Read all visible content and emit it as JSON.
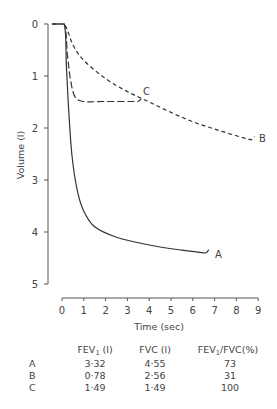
{
  "chart_data": {
    "type": "line",
    "title": "",
    "xlabel": "Time (sec)",
    "ylabel": "Volume (l)",
    "xlim": [
      0,
      9
    ],
    "ylim": [
      0,
      5
    ],
    "y_inverted": true,
    "grid": false,
    "x_ticks": [
      "0",
      "1",
      "2",
      "3",
      "4",
      "5",
      "6",
      "7",
      "8",
      "9"
    ],
    "y_ticks": [
      "0",
      "1",
      "2",
      "3",
      "4",
      "5"
    ],
    "series": [
      {
        "name": "A",
        "style": "solid",
        "points": [
          [
            -0.5,
            0
          ],
          [
            0.1,
            0
          ],
          [
            0.2,
            0.8
          ],
          [
            0.3,
            1.6
          ],
          [
            0.45,
            2.5
          ],
          [
            0.7,
            3.2
          ],
          [
            1.0,
            3.6
          ],
          [
            1.5,
            3.9
          ],
          [
            2.5,
            4.1
          ],
          [
            4,
            4.25
          ],
          [
            5.5,
            4.35
          ],
          [
            6.5,
            4.4
          ]
        ],
        "end_value": 4.55
      },
      {
        "name": "B",
        "style": "short-dash",
        "points": [
          [
            -0.5,
            0
          ],
          [
            0.1,
            0
          ],
          [
            0.5,
            0.4
          ],
          [
            1,
            0.7
          ],
          [
            2,
            1.05
          ],
          [
            3,
            1.3
          ],
          [
            4,
            1.5
          ],
          [
            5,
            1.7
          ],
          [
            6,
            1.88
          ],
          [
            7,
            2.02
          ],
          [
            8,
            2.15
          ],
          [
            8.6,
            2.22
          ]
        ],
        "end_value": 2.56
      },
      {
        "name": "C",
        "style": "long-dash",
        "points": [
          [
            -0.5,
            0
          ],
          [
            0.1,
            0
          ],
          [
            0.25,
            0.6
          ],
          [
            0.4,
            1.1
          ],
          [
            0.6,
            1.4
          ],
          [
            1.0,
            1.49
          ],
          [
            2,
            1.49
          ],
          [
            3.4,
            1.49
          ]
        ],
        "end_value": 1.49
      }
    ],
    "annotations": [
      "A",
      "B",
      "C"
    ],
    "table": {
      "headers": [
        "",
        "FEV1 (l)",
        "FVC (l)",
        "FEV1/FVC(%)"
      ],
      "rows": [
        {
          "label": "A",
          "fev1": "3·32",
          "fvc": "4·55",
          "ratio": "73"
        },
        {
          "label": "B",
          "fev1": "0·78",
          "fvc": "2·56",
          "ratio": "31"
        },
        {
          "label": "C",
          "fev1": "1·49",
          "fvc": "1·49",
          "ratio": "100"
        }
      ]
    }
  },
  "labels": {
    "xlabel": "Time (sec)",
    "ylabel": "Volume (l)",
    "curve_a": "A",
    "curve_b": "B",
    "curve_c": "C",
    "hdr_fev1_main": "FEV",
    "hdr_fev1_sub": "1",
    "hdr_fev1_unit": " (l)",
    "hdr_fvc": "FVC (l)",
    "hdr_ratio_main": "FEV",
    "hdr_ratio_sub": "1",
    "hdr_ratio_rest": "/FVC(%)"
  }
}
